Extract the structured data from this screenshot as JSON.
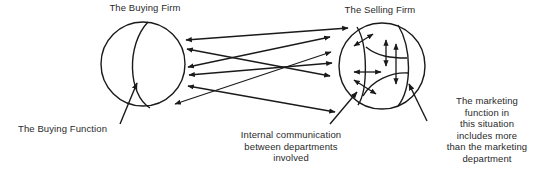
{
  "diagram": {
    "buying_firm": {
      "title": "The Buying Firm",
      "function_label": "The Buying Function"
    },
    "selling_firm": {
      "title": "The Selling Firm"
    },
    "annotations": {
      "internal_communication": [
        "Internal communication",
        "between departments",
        "involved"
      ],
      "marketing_function": [
        "The marketing",
        "function in",
        "this situation",
        "includes more",
        "than the marketing",
        "department"
      ]
    },
    "colors": {
      "stroke": "#1a1a1a",
      "background": "#ffffff",
      "text": "#2a2a2a"
    },
    "inter_firm_arrow_count": 8,
    "internal_arrow_count": 5
  }
}
